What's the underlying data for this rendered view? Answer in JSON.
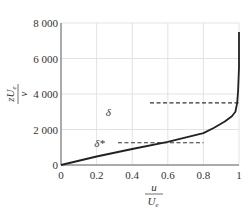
{
  "chart_data": {
    "type": "line",
    "title": "",
    "xlabel": "u / U_e",
    "ylabel": "z U_e / ν",
    "xlabel_num": "u",
    "xlabel_den": "U",
    "xlabel_den_sub": "e",
    "ylabel_num": "zU",
    "ylabel_num_sub": "e",
    "ylabel_den": "ν",
    "xlim": [
      0,
      1
    ],
    "ylim": [
      0,
      8000
    ],
    "grid": true,
    "x_ticks": [
      "0",
      "0.2",
      "0.4",
      "0.6",
      "0.8",
      "1"
    ],
    "x_tick_values": [
      0,
      0.2,
      0.4,
      0.6,
      0.8,
      1.0
    ],
    "y_ticks": [
      "0",
      "2 000",
      "4 000",
      "6 000",
      "8 000"
    ],
    "y_tick_values": [
      0,
      2000,
      4000,
      6000,
      8000
    ],
    "series": [
      {
        "name": "velocity profile",
        "style": "solid",
        "x": [
          0,
          0.2,
          0.4,
          0.6,
          0.8,
          0.86,
          0.92,
          0.96,
          0.98,
          0.99,
          0.995,
          1.0,
          1.0
        ],
        "y": [
          0,
          480,
          900,
          1300,
          1800,
          2100,
          2450,
          2750,
          3000,
          3500,
          4200,
          5500,
          7500
        ]
      }
    ],
    "annotations": [
      {
        "label": "δ",
        "style": "dashed",
        "y": 3500,
        "x_start": 0.5,
        "x_end": 1.0,
        "label_x": 0.3,
        "label_y": 3000
      },
      {
        "label": "δ*",
        "style": "dashed",
        "y": 1250,
        "x_start": 0.32,
        "x_end": 0.8,
        "label_x": 0.25,
        "label_y": 1250
      }
    ]
  }
}
